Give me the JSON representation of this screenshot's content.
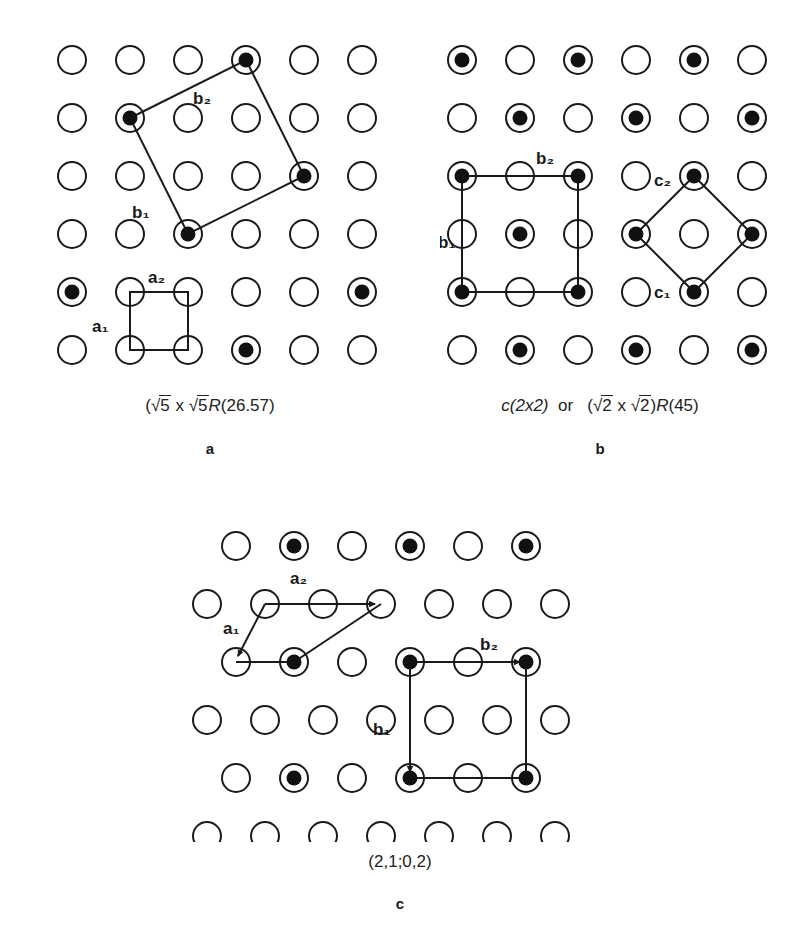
{
  "figure": {
    "background_color": "#ffffff",
    "line_color": "#1a1a1a",
    "substrate_circle_fill": "#ffffff",
    "adsorbate_dot_fill": "#111111"
  },
  "panels": [
    {
      "id": "a",
      "letter": "a",
      "caption_parts": {
        "open_paren": "(",
        "radical1": "√",
        "num1": "5",
        "times": " x ",
        "radical2": "√",
        "num2": "5",
        "R": "R",
        "angle": "(26.57)"
      },
      "caption_plain": "(√5 x √5R(26.57)",
      "vector_labels": [
        "b₂",
        "b₁",
        "a₂",
        "a₁"
      ],
      "lattice": {
        "type": "square",
        "rows": 6,
        "cols": 6,
        "spacing": 58,
        "circle_radius": 14,
        "filled_radius": 7.5,
        "filled_sites": [
          [
            0,
            3
          ],
          [
            1,
            1
          ],
          [
            2,
            4
          ],
          [
            3,
            2
          ],
          [
            4,
            0
          ],
          [
            4,
            5
          ],
          [
            5,
            3
          ]
        ]
      },
      "cells": [
        {
          "name": "superlattice-cell-b",
          "kind": "polygon",
          "vertices": [
            [
              1,
              1
            ],
            [
              0,
              3
            ],
            [
              2,
              4
            ],
            [
              3,
              2
            ]
          ],
          "labels": [
            {
              "text": "b₂",
              "site": "top-edge"
            },
            {
              "text": "b₁",
              "site": "left-edge"
            }
          ]
        },
        {
          "name": "substrate-cell-a",
          "kind": "polygon",
          "vertices": [
            [
              4,
              1
            ],
            [
              4,
              2
            ],
            [
              5,
              2
            ],
            [
              5,
              1
            ]
          ],
          "labels": [
            {
              "text": "a₂",
              "site": "top-edge"
            },
            {
              "text": "a₁",
              "site": "left-edge"
            }
          ]
        }
      ]
    },
    {
      "id": "b",
      "letter": "b",
      "caption_parts": {
        "c_notation": "c(2x2)",
        "or": "or",
        "open_paren": "(",
        "radical1": "√",
        "num1": "2",
        "times": " x ",
        "radical2": "√",
        "num2": "2",
        "close_paren": ")",
        "R": "R",
        "angle": "(45)"
      },
      "caption_plain": "c(2x2)  or  (√2 x √2)R(45)",
      "vector_labels": [
        "b₂",
        "b₁",
        "c₂",
        "c₁"
      ],
      "lattice": {
        "type": "square-checkerboard",
        "rows": 6,
        "cols": 6,
        "spacing": 58,
        "circle_radius": 14,
        "filled_radius": 7.5,
        "filled_parity": "row+col even"
      },
      "cells": [
        {
          "name": "primitive-cell-b",
          "kind": "rect",
          "vertices": [
            [
              2,
              0
            ],
            [
              2,
              2
            ],
            [
              4,
              2
            ],
            [
              4,
              0
            ]
          ],
          "labels": [
            {
              "text": "b₂",
              "site": "top-edge"
            },
            {
              "text": "b₁",
              "site": "left-edge"
            }
          ]
        },
        {
          "name": "rotated-cell-c",
          "kind": "polygon",
          "vertices": [
            [
              2,
              4
            ],
            [
              3,
              3
            ],
            [
              4,
              4
            ],
            [
              3,
              5
            ]
          ],
          "labels": [
            {
              "text": "c₂",
              "site": "top-vertex"
            },
            {
              "text": "c₁",
              "site": "bottom-vertex"
            }
          ]
        }
      ]
    },
    {
      "id": "c",
      "letter": "c",
      "caption_parts": {
        "notation": "(2,1;0,2)"
      },
      "caption_plain": "(2,1;0,2)",
      "vector_labels": [
        "a₂",
        "a₁",
        "b₂",
        "b₁"
      ],
      "lattice": {
        "type": "hexagonal-staggered",
        "rows": 5,
        "cols": 7,
        "spacing_x": 58,
        "spacing_y": 58,
        "row_offset_x": 29,
        "circle_radius": 14,
        "filled_radius": 7.5,
        "filled_rows": [
          0,
          2,
          4
        ],
        "filled_sites": [
          [
            0,
            1
          ],
          [
            0,
            3
          ],
          [
            0,
            5
          ],
          [
            2,
            1
          ],
          [
            2,
            4
          ],
          [
            2,
            6
          ],
          [
            4,
            1
          ],
          [
            4,
            3
          ],
          [
            4,
            5
          ]
        ]
      },
      "cells": [
        {
          "name": "substrate-cell-a",
          "kind": "rhombus",
          "labels": [
            {
              "text": "a₂",
              "site": "top-edge"
            },
            {
              "text": "a₁",
              "site": "left-edge"
            }
          ]
        },
        {
          "name": "superlattice-cell-b",
          "kind": "rect",
          "labels": [
            {
              "text": "b₂",
              "site": "top-edge"
            },
            {
              "text": "b₁",
              "site": "left-edge"
            }
          ]
        }
      ]
    }
  ]
}
